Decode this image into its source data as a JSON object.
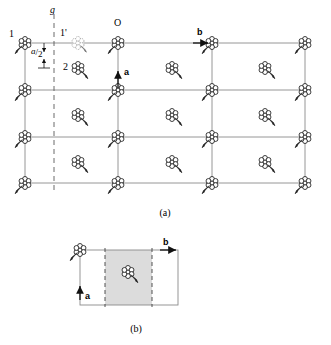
{
  "figure": {
    "panels": [
      {
        "id": "a",
        "caption": "(a)",
        "description": "Plan of lattice with rosette motifs at corners and cell centres, glide line g parallel to a, translation a/2"
      },
      {
        "id": "b",
        "caption": "(b)",
        "description": "Single unit cell with shaded glide strip and axes a and b"
      }
    ],
    "labels": {
      "glide_line": "g",
      "motif_one": "1",
      "motif_one_prime": "1'",
      "motif_two": "2",
      "origin": "O",
      "axis_b": "b",
      "axis_a": "a",
      "translation_numerator": "a",
      "translation_slash": "/",
      "translation_denominator": "2"
    },
    "colors": {
      "line": "#808080",
      "motif_outline": "#000000",
      "glide_dash": "#555555",
      "shade_fill": "#d9d9d9",
      "background": "#ffffff"
    },
    "geometry": {
      "panel_a": {
        "columns_x": [
          25,
          118,
          212,
          305
        ],
        "rows_y": [
          43,
          90,
          137,
          183
        ],
        "interior_x": [
          78,
          172,
          265
        ],
        "interior_y": [
          68,
          115,
          162
        ],
        "glide_x": 54,
        "glide_top": 14,
        "glide_bottom": 191
      },
      "panel_b": {
        "left": 80,
        "right": 178,
        "top": 250,
        "bottom": 305,
        "dash_left": 105,
        "dash_right": 152
      }
    }
  }
}
